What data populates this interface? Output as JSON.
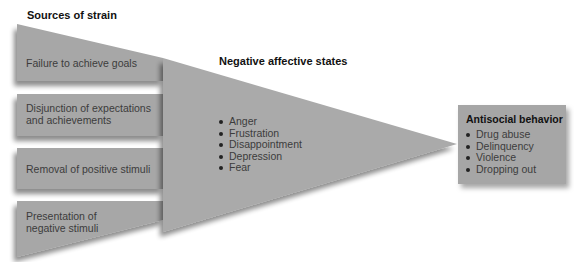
{
  "diagram": {
    "sources": {
      "title": "Sources of strain",
      "items": [
        {
          "label": "Failure to achieve goals"
        },
        {
          "label": "Disjunction of expectations and achievements",
          "lines": [
            "Disjunction of expectations",
            "and achievements"
          ]
        },
        {
          "label": "Removal of positive stimuli"
        },
        {
          "label": "Presentation of negative stimuli",
          "lines": [
            "Presentation of",
            "negative stimuli"
          ]
        }
      ]
    },
    "states": {
      "title": "Negative affective states",
      "items": [
        "Anger",
        "Frustration",
        "Disappointment",
        "Depression",
        "Fear"
      ]
    },
    "outcome": {
      "title": "Antisocial behavior",
      "items": [
        "Drug abuse",
        "Delinquency",
        "Violence",
        "Dropping out"
      ]
    },
    "colors": {
      "fill": "#a6a6a6",
      "fill_light": "#b0b0b0",
      "title_text": "#111111",
      "body_text": "#3c3c3c"
    }
  }
}
